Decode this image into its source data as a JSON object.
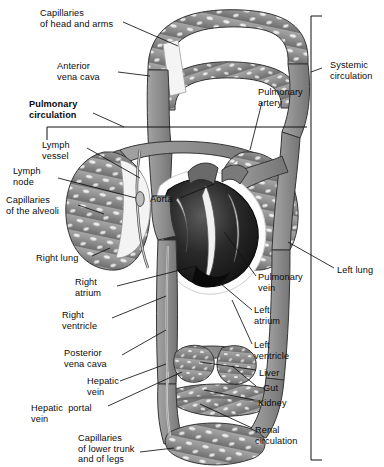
{
  "figure": {
    "type": "anatomical-diagram",
    "palette": {
      "vessel_fill": "#8f8f8f",
      "vessel_outline": "#3a3a3a",
      "lumen": "#e8e8e8",
      "heart_dark": "#161616",
      "heart_mid": "#4a4a4a",
      "heart_light": "#f2f2f2",
      "leader_line": "#111111",
      "background": "#ffffff",
      "text": "#0b0b0b"
    }
  },
  "brackets": [
    {
      "id": "pulmonary",
      "label": "Pulmonary\ncirculation",
      "bold": true,
      "side": "left"
    },
    {
      "id": "systemic",
      "label": "Systemic\ncirculation",
      "bold": false,
      "side": "right"
    }
  ],
  "labels_left": [
    {
      "name": "capillaries-head-arms",
      "text": "Capillaries\nof head and arms",
      "x": 40,
      "y": 8
    },
    {
      "name": "anterior-vena-cava",
      "text": "Anterior\nvena cava",
      "x": 57,
      "y": 61
    },
    {
      "name": "pulmonary-circulation",
      "text": "Pulmonary\ncirculation",
      "x": 29,
      "y": 99,
      "bold": true
    },
    {
      "name": "lymph-vessel",
      "text": "Lymph\nvessel",
      "x": 42,
      "y": 140
    },
    {
      "name": "lymph-node",
      "text": "Lymph\nnode",
      "x": 13,
      "y": 166
    },
    {
      "name": "capillaries-alveoli",
      "text": "Capillaries\nof the alveoli",
      "x": 6,
      "y": 195
    },
    {
      "name": "right-lung",
      "text": "Right lung",
      "x": 36,
      "y": 253
    },
    {
      "name": "right-atrium",
      "text": "Right\natrium",
      "x": 75,
      "y": 277
    },
    {
      "name": "right-ventricle",
      "text": "Right\nventricle",
      "x": 62,
      "y": 310
    },
    {
      "name": "posterior-vena-cava",
      "text": "Posterior\nvena cava",
      "x": 64,
      "y": 348
    },
    {
      "name": "hepatic-vein",
      "text": "Hepatic\nvein",
      "x": 87,
      "y": 376
    },
    {
      "name": "hepatic-portal-vein",
      "text": "Hepatic  portal\nvein",
      "x": 31,
      "y": 403
    },
    {
      "name": "capillaries-lower-trunk",
      "text": "Capillaries\nof lower trunk\nand of legs",
      "x": 78,
      "y": 433
    }
  ],
  "labels_right": [
    {
      "name": "pulmonary-artery",
      "text": "Pulmonary\nartery",
      "x": 258,
      "y": 87
    },
    {
      "name": "systemic-circulation",
      "text": "Systemic\ncirculation",
      "x": 330,
      "y": 60
    },
    {
      "name": "aorta",
      "text": "Aorta",
      "x": 150,
      "y": 194
    },
    {
      "name": "left-lung",
      "text": "Left lung",
      "x": 337,
      "y": 265
    },
    {
      "name": "pulmonary-vein",
      "text": "Pulmonary\nvein",
      "x": 258,
      "y": 272
    },
    {
      "name": "left-atrium",
      "text": "Left\natrium",
      "x": 254,
      "y": 305
    },
    {
      "name": "left-ventricle",
      "text": "Left\nventricle",
      "x": 254,
      "y": 340
    },
    {
      "name": "liver",
      "text": "Liver",
      "x": 259,
      "y": 368
    },
    {
      "name": "gut",
      "text": "Gut",
      "x": 263,
      "y": 383
    },
    {
      "name": "kidney",
      "text": "Kidney",
      "x": 258,
      "y": 398
    },
    {
      "name": "renal-circulation",
      "text": "Renal\ncirculation",
      "x": 255,
      "y": 425
    }
  ],
  "structures": [
    "capillary bed of head and arms (upper arch)",
    "anterior vena cava",
    "right lung alveolar capillary bed",
    "left lung alveolar capillary bed",
    "lymph vessel and lymph node",
    "heart (right atrium, right ventricle, left atrium, left ventricle)",
    "aorta",
    "pulmonary artery",
    "pulmonary vein",
    "posterior vena cava",
    "hepatic vein",
    "hepatic portal vein",
    "liver capillary bed",
    "gut capillary bed",
    "kidney / renal circulation capillary bed",
    "capillaries of lower trunk and legs"
  ]
}
